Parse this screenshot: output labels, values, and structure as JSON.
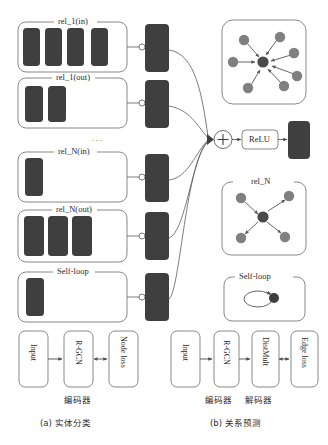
{
  "figure": {
    "type": "diagram"
  },
  "left_panel": {
    "groups": [
      {
        "label": "rel_1(in)",
        "bars": 4
      },
      {
        "label": "rel_1(out)",
        "bars": 2
      },
      {
        "label": "rel_N(in)",
        "bars": 1
      },
      {
        "label": "rel_N(out)",
        "bars": 3
      },
      {
        "label": "Self-loop",
        "bars": 1
      }
    ],
    "ellipsis": "...",
    "pipeline": {
      "boxes": [
        "Input",
        "R-GCN",
        "Node loss"
      ],
      "encoder_label": "编码器",
      "caption": "(a) 实体分类"
    }
  },
  "center": {
    "sum_symbol": "+",
    "activation_label": "ReLU"
  },
  "right_panel": {
    "graph_top": {
      "label": "",
      "outer_nodes": 7,
      "direction": "inward"
    },
    "graph_rel_n": {
      "label": "rel_N",
      "outer_nodes": 4,
      "direction": "outward"
    },
    "self_loop": {
      "label": "Self-loop"
    },
    "pipeline": {
      "boxes": [
        "Input",
        "R-GCN",
        "DistMult",
        "Edge loss"
      ],
      "encoder_label": "编码器",
      "decoder_label": "解码器",
      "caption": "(b) 关系预测"
    }
  },
  "colors": {
    "bar_fill": "#3f3f3f",
    "node_fill": "#808080",
    "center_node_fill": "#4a4a4a",
    "outline": "#6b6b6b",
    "line": "#5a5a5a",
    "text": "#2b2b2b"
  }
}
